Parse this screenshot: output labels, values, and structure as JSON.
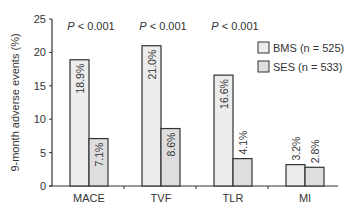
{
  "chart_data": {
    "type": "bar",
    "title": "",
    "xlabel": "",
    "ylabel": "9-month adverse events (%)",
    "ylim": [
      0,
      25
    ],
    "yticks": [
      0,
      5,
      10,
      15,
      20,
      25
    ],
    "ytick_labels": [
      "0",
      "5",
      "10",
      "15",
      "20",
      "25"
    ],
    "grid": false,
    "categories": [
      "MACE",
      "TVF",
      "TLR",
      "MI"
    ],
    "series": [
      {
        "name": "BMS (n = 525)",
        "color": "#ececec",
        "values": [
          18.9,
          21.0,
          16.6,
          3.2
        ],
        "labels": [
          "18.9%",
          "21.0%",
          "16.6%",
          "3.2%"
        ]
      },
      {
        "name": "SES (n = 533)",
        "color": "#dedede",
        "values": [
          7.1,
          8.6,
          4.1,
          2.8
        ],
        "labels": [
          "7.1%",
          "8.6%",
          "4.1%",
          "2.8%"
        ]
      }
    ],
    "annotations": [
      {
        "category": "MACE",
        "p_symbol": "P",
        "text": " < 0.001"
      },
      {
        "category": "TVF",
        "p_symbol": "P",
        "text": " < 0.001"
      },
      {
        "category": "TLR",
        "p_symbol": "P",
        "text": " < 0.001"
      }
    ],
    "legend_position": "top-right",
    "bar_outline_color": "#333333"
  }
}
